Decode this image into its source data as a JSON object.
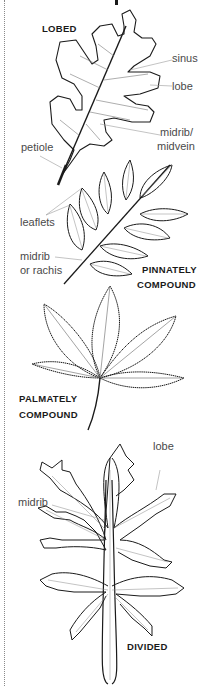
{
  "figure": {
    "title_fragment": "y",
    "sections": [
      {
        "id": "lobed",
        "title": "LOBED",
        "callouts": [
          "sinus",
          "lobe",
          "midrib/",
          "midvein",
          "petiole"
        ]
      },
      {
        "id": "pinnately-compound",
        "title_line1": "PINNATELY",
        "title_line2": "COMPOUND",
        "callouts": [
          "leaflets",
          "midrib",
          "or rachis"
        ]
      },
      {
        "id": "palmately-compound",
        "title_line1": "PALMATELY",
        "title_line2": "COMPOUND"
      },
      {
        "id": "divided",
        "title": "DIVIDED",
        "callouts": [
          "lobe",
          "midrib"
        ]
      }
    ]
  },
  "colors": {
    "line": "#1a1a1a",
    "leader": "#9a9a9a",
    "label": "#4a4a4a",
    "border": "#8a8a8a"
  }
}
